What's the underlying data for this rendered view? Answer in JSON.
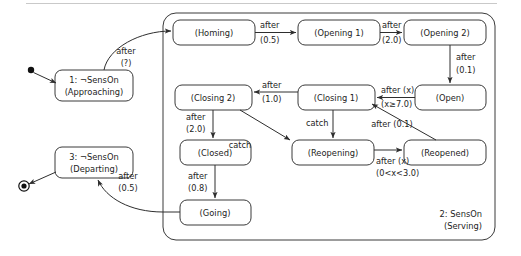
{
  "diagram": {
    "kind": "state-machine-diagram",
    "title_visible": false,
    "frame": {
      "top_rule_color": "#c9c9c9"
    },
    "pseudostates": {
      "initial": {
        "name": "initial-state-marker",
        "cx": 31,
        "cy": 70,
        "r": 3.2
      },
      "final": {
        "name": "final-state-marker",
        "cx": 24,
        "cy": 186,
        "r_outer": 5.2,
        "r_inner": 2.6
      }
    },
    "outer_states": [
      {
        "id": "approaching",
        "line1": "1: ¬SensOn",
        "line2": "(Approaching)",
        "x": 55,
        "y": 70,
        "w": 78,
        "h": 31
      },
      {
        "id": "departing",
        "line1": "3: ¬SensOn",
        "line2": "(Departing)",
        "x": 55,
        "y": 147,
        "w": 78,
        "h": 31
      }
    ],
    "region": {
      "id": "serving-region",
      "label_line1": "2: SensOn",
      "label_line2": "(Serving)",
      "x": 163,
      "y": 13,
      "w": 332,
      "h": 227,
      "label_x": 482,
      "label_y1": 214,
      "label_y2": 226
    },
    "inner_states": [
      {
        "id": "homing",
        "label": "(Homing)",
        "x": 173,
        "y": 20,
        "w": 82,
        "h": 25
      },
      {
        "id": "opening1",
        "label": "(Opening 1)",
        "x": 298,
        "y": 20,
        "w": 82,
        "h": 25
      },
      {
        "id": "opening2",
        "label": "(Opening 2)",
        "x": 404,
        "y": 20,
        "w": 82,
        "h": 25
      },
      {
        "id": "open",
        "label": "(Open)",
        "x": 415,
        "y": 85,
        "w": 71,
        "h": 25
      },
      {
        "id": "closing1",
        "label": "(Closing 1)",
        "x": 298,
        "y": 85,
        "w": 77,
        "h": 25
      },
      {
        "id": "closing2",
        "label": "(Closing 2)",
        "x": 175,
        "y": 85,
        "w": 77,
        "h": 25
      },
      {
        "id": "closed",
        "label": "(Closed)",
        "x": 180,
        "y": 140,
        "w": 71,
        "h": 25
      },
      {
        "id": "going",
        "label": "(Going)",
        "x": 180,
        "y": 200,
        "w": 71,
        "h": 25
      },
      {
        "id": "reopening",
        "label": "(Reopening)",
        "x": 292,
        "y": 140,
        "w": 82,
        "h": 25
      },
      {
        "id": "reopened",
        "label": "(Reopened)",
        "x": 404,
        "y": 140,
        "w": 82,
        "h": 25
      }
    ],
    "transitions": [
      {
        "id": "t-init-approaching",
        "label_line1": "",
        "label_line2": ""
      },
      {
        "id": "t-approaching-homing",
        "label_line1": "after",
        "label_line2": "(?)",
        "label_x": 126,
        "label_y": 51
      },
      {
        "id": "t-homing-opening1",
        "label_line1": "after",
        "label_line2": "(0.5)",
        "label_x": 260,
        "label_y": 26
      },
      {
        "id": "t-opening1-opening2",
        "label_line1": "after",
        "label_line2": "(2.0)",
        "label_x": 384,
        "label_y": 26
      },
      {
        "id": "t-opening2-open",
        "label_line1": "after",
        "label_line2": "(0.1)",
        "label_x": 455,
        "label_y": 58
      },
      {
        "id": "t-open-closing1",
        "label_line1": "after (x)",
        "label_line2": "(x≥7.0)",
        "label_x": 379,
        "label_y": 91
      },
      {
        "id": "t-closing1-closing2",
        "label_line1": "after",
        "label_line2": "(1.0)",
        "label_x": 262,
        "label_y": 91
      },
      {
        "id": "t-closing2-closed",
        "label_line1": "after",
        "label_line2": "(2.0)",
        "label_x": 186,
        "label_y": 117
      },
      {
        "id": "t-closed-going",
        "label_line1": "after",
        "label_line2": "(0.8)",
        "label_x": 186,
        "label_y": 177
      },
      {
        "id": "t-going-departing",
        "label_line1": "after",
        "label_line2": "(0.5)",
        "label_x": 128,
        "label_y": 175
      },
      {
        "id": "t-closing1-reopening",
        "label_line1": "catch",
        "label_line2": "",
        "label_x": 311,
        "label_y": 123
      },
      {
        "id": "t-closing2-reopening",
        "label_line1": "catch",
        "label_line2": "",
        "label_x": 254,
        "label_y": 144
      },
      {
        "id": "t-reopening-reopened",
        "label_line1": "after (x)",
        "label_line2": "(0<x<3.0)",
        "label_x": 376,
        "label_y": 162
      },
      {
        "id": "t-reopened-closing1",
        "label_line1": "after (0.1)",
        "label_line2": "",
        "label_x": 392,
        "label_y": 124
      }
    ]
  }
}
